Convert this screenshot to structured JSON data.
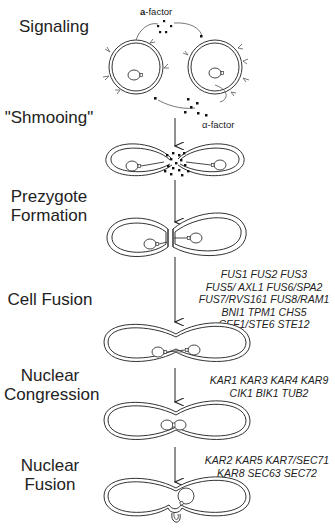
{
  "stages": [
    {
      "label_lines": [
        "Signaling"
      ]
    },
    {
      "label_lines": [
        "\"Shmooing\""
      ]
    },
    {
      "label_lines": [
        "Prezygote",
        "Formation"
      ]
    },
    {
      "label_lines": [
        "Cell Fusion"
      ]
    },
    {
      "label_lines": [
        "Nuclear",
        "Congression"
      ]
    },
    {
      "label_lines": [
        "Nuclear",
        "Fusion"
      ]
    }
  ],
  "signaling": {
    "a_factor_bold": "a",
    "a_factor_rest": "-factor",
    "alpha_factor": "α-factor",
    "cell_a_label": "a",
    "cell_alpha_label": "α"
  },
  "gene_groups": {
    "cell_fusion": [
      "FUS1  FUS2  FUS3",
      "FUS5/ AXL1  FUS6/SPA2",
      "FUS7/RVS161  FUS8/RAM1",
      "BNI1 TPM1 CHS5",
      "CEF1/STE6  STE12"
    ],
    "nuclear_congression": [
      "KAR1  KAR3 KAR4  KAR9",
      "CIK1  BIK1  TUB2"
    ],
    "nuclear_fusion": [
      "KAR2  KAR5  KAR7/SEC71",
      "KAR8  SEC63 SEC72"
    ]
  }
}
